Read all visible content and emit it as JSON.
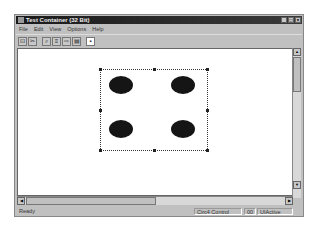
{
  "window": {
    "title": "Test Container (32 Bit)",
    "controls": {
      "minimize": "_",
      "maximize": "□",
      "close": "×"
    }
  },
  "menu": [
    "File",
    "Edit",
    "View",
    "Options",
    "Help"
  ],
  "toolbar": {
    "buttons": [
      {
        "name": "insert-control-icon",
        "glyph": "⊡"
      },
      {
        "name": "delete-control-icon",
        "glyph": "✂"
      },
      {
        "name": "properties-icon",
        "glyph": "⌕"
      },
      {
        "name": "invoke-methods-icon",
        "glyph": "≡"
      },
      {
        "name": "macro-icon",
        "glyph": "⇨"
      },
      {
        "name": "event-log-icon",
        "glyph": "▤"
      },
      {
        "name": "ambient-icon",
        "glyph": "▪"
      }
    ]
  },
  "control": {
    "ellipses": 4,
    "color": "#151515"
  },
  "statusbar": {
    "message": "Ready",
    "control_name": "Circ4 Control",
    "code": "00",
    "state": "UIActive"
  }
}
